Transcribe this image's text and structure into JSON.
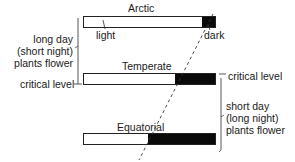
{
  "diagram": {
    "bars": [
      {
        "name": "Arctic",
        "label": "Arctic",
        "light_fraction": 0.9,
        "dark_fraction": 0.1
      },
      {
        "name": "Temperate",
        "label": "Temperate",
        "light_fraction": 0.7,
        "dark_fraction": 0.3
      },
      {
        "name": "Equatorial",
        "label": "Equatorial",
        "light_fraction": 0.5,
        "dark_fraction": 0.5
      }
    ],
    "labels": {
      "light": "light",
      "dark": "dark",
      "critical_left": "critical level",
      "critical_right": "critical level"
    },
    "long_day_group": {
      "line1": "long day",
      "line2": "(short night)",
      "line3": "plants flower"
    },
    "short_day_group": {
      "line1": "short day",
      "line2": "(long night)",
      "line3": "plants flower"
    },
    "colors": {
      "light": "#ffffff",
      "dark": "#0a0a0a",
      "outline": "#222222"
    }
  }
}
